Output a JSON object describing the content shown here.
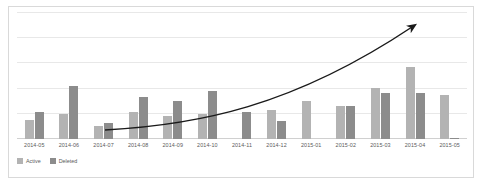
{
  "chart_data": {
    "type": "bar",
    "title": "",
    "subtitle": "",
    "xlabel": "",
    "ylabel": "",
    "grid": true,
    "legend_position": "bottom-left",
    "ylim": [
      0,
      100
    ],
    "gridline_values": [
      0,
      20,
      40,
      60,
      80,
      100
    ],
    "categories": [
      "2014-05",
      "2014-06",
      "2014-07",
      "2014-08",
      "2014-09",
      "2014-10",
      "2014-11",
      "2014-12",
      "2015-01",
      "2015-02",
      "2015-03",
      "2015-04",
      "2015-05"
    ],
    "series": [
      {
        "name": "Active",
        "color": "#b3b3b3",
        "values": [
          15,
          20,
          10,
          21,
          18,
          20,
          0,
          23,
          30,
          26,
          40,
          57,
          35
        ]
      },
      {
        "name": "Deleted",
        "color": "#8c8c8c",
        "values": [
          21,
          42,
          13,
          33,
          30,
          38,
          21,
          14,
          0,
          26,
          36,
          36,
          1
        ]
      }
    ],
    "annotations": [
      {
        "type": "trend-arrow",
        "label": "",
        "description": "upward curving growth arrow from 2014-07 to 2015-04"
      }
    ]
  },
  "legend": {
    "items": [
      {
        "label": "Active",
        "color": "#b3b3b3"
      },
      {
        "label": "Deleted",
        "color": "#8c8c8c"
      }
    ]
  },
  "colors": {
    "active": "#b3b3b3",
    "deleted": "#8c8c8c",
    "gridline": "#e8e8e8",
    "frame": "#d9d9d9",
    "trend": "#1a1a1a",
    "text": "#5a5a5a"
  }
}
